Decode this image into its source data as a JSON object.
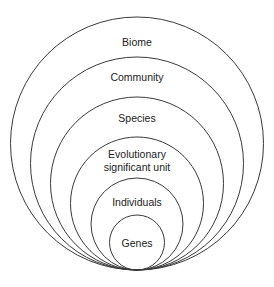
{
  "diagram": {
    "type": "nested-circles",
    "stroke_color": "#3a3a3a",
    "text_color": "#222222",
    "tangent_point": {
      "x": 137,
      "y": 270
    },
    "levels": [
      {
        "label": "Biome",
        "lines": [
          "Biome"
        ],
        "top_y": 17
      },
      {
        "label": "Community",
        "lines": [
          "Community"
        ],
        "top_y": 57
      },
      {
        "label": "Species",
        "lines": [
          "Species"
        ],
        "top_y": 97
      },
      {
        "label": "Evolutionary significant unit",
        "lines": [
          "Evolutionary",
          "significant unit"
        ],
        "top_y": 137
      },
      {
        "label": "Individuals",
        "lines": [
          "Individuals"
        ],
        "top_y": 178
      },
      {
        "label": "Genes",
        "lines": [
          "Genes"
        ],
        "top_y": 215
      }
    ]
  }
}
